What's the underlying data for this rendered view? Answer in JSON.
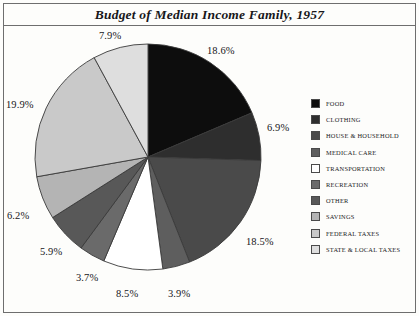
{
  "title": "Budget of Median Income Family, 1957",
  "legend": {
    "items": [
      {
        "label": "FOOD",
        "color": "#0d0d0d"
      },
      {
        "label": "CLOTHING",
        "color": "#2e2e2e"
      },
      {
        "label": "HOUSE & HOUSEHOLD",
        "color": "#4a4a4a"
      },
      {
        "label": "MEDICAL CARE",
        "color": "#5e5e5e"
      },
      {
        "label": "TRANSPORTATION",
        "color": "#ffffff"
      },
      {
        "label": "RECREATION",
        "color": "#6a6a6a"
      },
      {
        "label": "OTHER",
        "color": "#585858"
      },
      {
        "label": "SAVINGS",
        "color": "#b4b4b4"
      },
      {
        "label": "FEDERAL TAXES",
        "color": "#c9c9c9"
      },
      {
        "label": "STATE & LOCAL TAXES",
        "color": "#dedede"
      }
    ]
  },
  "chart_data": {
    "type": "pie",
    "title": "Budget of Median Income Family, 1957",
    "xlabel": "",
    "ylabel": "",
    "legend_position": "right",
    "start_angle_deg": 0,
    "direction": "clockwise",
    "unit": "percent",
    "categories": [
      "FOOD",
      "CLOTHING",
      "HOUSE & HOUSEHOLD",
      "MEDICAL CARE",
      "TRANSPORTATION",
      "RECREATION",
      "OTHER",
      "SAVINGS",
      "FEDERAL TAXES",
      "STATE & LOCAL TAXES"
    ],
    "values": [
      18.6,
      6.9,
      18.5,
      3.9,
      8.5,
      3.7,
      5.9,
      6.2,
      19.9,
      7.9
    ],
    "labels": [
      "18.6%",
      "6.9%",
      "18.5%",
      "3.9%",
      "8.5%",
      "3.7%",
      "5.9%",
      "6.2%",
      "19.9%",
      "7.9%"
    ],
    "colors": [
      "#0d0d0d",
      "#2e2e2e",
      "#4a4a4a",
      "#5e5e5e",
      "#ffffff",
      "#6a6a6a",
      "#585858",
      "#b4b4b4",
      "#c9c9c9",
      "#dedede"
    ],
    "slices": [
      {
        "name": "FOOD",
        "value": 18.6,
        "label": "18.6%",
        "color": "#0d0d0d"
      },
      {
        "name": "CLOTHING",
        "value": 6.9,
        "label": "6.9%",
        "color": "#2e2e2e"
      },
      {
        "name": "HOUSE & HOUSEHOLD",
        "value": 18.5,
        "label": "18.5%",
        "color": "#4a4a4a"
      },
      {
        "name": "MEDICAL CARE",
        "value": 3.9,
        "label": "3.9%",
        "color": "#5e5e5e"
      },
      {
        "name": "TRANSPORTATION",
        "value": 8.5,
        "label": "8.5%",
        "color": "#ffffff"
      },
      {
        "name": "RECREATION",
        "value": 3.7,
        "label": "3.7%",
        "color": "#6a6a6a"
      },
      {
        "name": "OTHER",
        "value": 5.9,
        "label": "5.9%",
        "color": "#585858"
      },
      {
        "name": "SAVINGS",
        "value": 6.2,
        "label": "6.2%",
        "color": "#b4b4b4"
      },
      {
        "name": "FEDERAL TAXES",
        "value": 19.9,
        "label": "19.9%",
        "color": "#c9c9c9"
      },
      {
        "name": "STATE & LOCAL TAXES",
        "value": 7.9,
        "label": "7.9%",
        "color": "#dedede"
      }
    ],
    "label_positions": [
      {
        "label": "18.6%",
        "x": 207,
        "y": 45
      },
      {
        "label": "6.9%",
        "x": 267,
        "y": 122
      },
      {
        "label": "18.5%",
        "x": 246,
        "y": 236
      },
      {
        "label": "3.9%",
        "x": 168,
        "y": 288
      },
      {
        "label": "8.5%",
        "x": 116,
        "y": 288
      },
      {
        "label": "3.7%",
        "x": 76,
        "y": 272
      },
      {
        "label": "5.9%",
        "x": 40,
        "y": 246
      },
      {
        "label": "6.2%",
        "x": 7,
        "y": 210
      },
      {
        "label": "19.9%",
        "x": 6,
        "y": 99
      },
      {
        "label": "7.9%",
        "x": 99,
        "y": 30
      }
    ]
  }
}
